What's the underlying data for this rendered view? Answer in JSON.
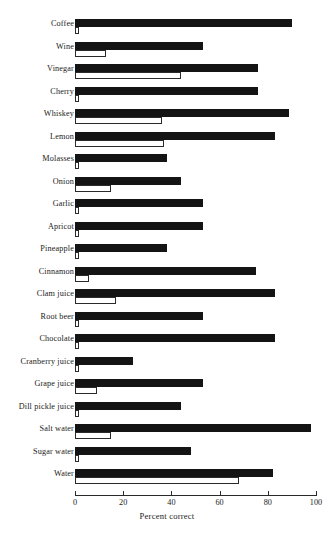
{
  "chart_data": {
    "type": "bar",
    "orientation": "horizontal",
    "title": "",
    "xlabel": "Percent correct",
    "ylabel": "",
    "xlim": [
      0,
      100
    ],
    "xticks": [
      0,
      20,
      40,
      60,
      80,
      100
    ],
    "xtick_labels": [
      "0",
      "20",
      "40",
      "60",
      "80",
      "100"
    ],
    "grid": false,
    "legend": null,
    "categories": [
      "Coffee",
      "Wine",
      "Vinegar",
      "Cherry",
      "Whiskey",
      "Lemon",
      "Molasses",
      "Onion",
      "Garlic",
      "Apricot",
      "Pineapple",
      "Cinnamon",
      "Clam juice",
      "Root beer",
      "Chocolate",
      "Cranberry juice",
      "Grape juice",
      "Dill pickle juice",
      "Salt water",
      "Sugar water",
      "Water"
    ],
    "series": [
      {
        "name": "filled",
        "style": "solid-black",
        "values": [
          90,
          53,
          76,
          76,
          89,
          83,
          38,
          44,
          53,
          53,
          38,
          75,
          83,
          53,
          83,
          24,
          53,
          44,
          98,
          48,
          82
        ]
      },
      {
        "name": "outline",
        "style": "white-outline",
        "values": [
          1,
          13,
          44,
          1,
          36,
          37,
          0,
          15,
          1,
          1,
          0,
          6,
          17,
          1,
          0,
          0,
          9,
          0,
          15,
          1,
          68
        ]
      }
    ]
  },
  "colors": {
    "bar_fill": "#141414",
    "bar_outline_stroke": "#2a2a2a",
    "bar_outline_fill": "#ffffff",
    "axis": "#2a2a2a",
    "background": "#ffffff",
    "text": "#1b1b1b"
  }
}
